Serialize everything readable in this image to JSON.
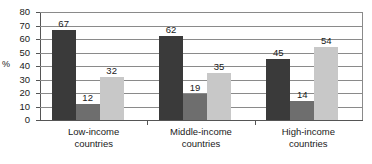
{
  "chart_data": {
    "type": "bar",
    "title": "",
    "xlabel": "",
    "ylabel": "%",
    "ylim": [
      0,
      80
    ],
    "ytick_step": 10,
    "yticks": [
      0,
      10,
      20,
      30,
      40,
      50,
      60,
      70,
      80
    ],
    "grid": true,
    "legend_position": "none",
    "categories": [
      "Low-income\ncountries",
      "Middle-income\ncountries",
      "High-income\ncountries"
    ],
    "category_lines": [
      [
        "Low-income",
        "countries"
      ],
      [
        "Middle-income",
        "countries"
      ],
      [
        "High-income",
        "countries"
      ]
    ],
    "series": [
      {
        "name": "series-1",
        "color": "#3a3a3a",
        "values": [
          67,
          62,
          45
        ]
      },
      {
        "name": "series-2",
        "color": "#6e6e6e",
        "values": [
          12,
          19,
          14
        ]
      },
      {
        "name": "series-3",
        "color": "#c8c8c8",
        "values": [
          32,
          35,
          54
        ]
      }
    ],
    "data_labels": [
      67,
      12,
      32,
      62,
      19,
      35,
      45,
      14,
      54
    ]
  },
  "colors": {
    "series_1": "#3a3a3a",
    "series_2": "#6e6e6e",
    "series_3": "#c8c8c8",
    "axis": "#555555",
    "grid": "#8a8a8a",
    "text": "#1a1a1a",
    "background": "#ffffff"
  }
}
